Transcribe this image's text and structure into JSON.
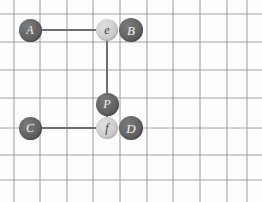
{
  "figure": {
    "name": "go-board-diagram",
    "width": 262,
    "height": 202,
    "background_color": "#fdfdfd"
  },
  "board": {
    "grid_color": "#8c8c8c",
    "grid_line_width": 1,
    "vertical_lines_x": [
      14,
      40,
      67,
      93,
      120,
      147,
      173,
      200,
      227,
      247
    ],
    "horizontal_lines_y": [
      14,
      42,
      70,
      98,
      128,
      155,
      180
    ],
    "cell_size": 26.6
  },
  "chains": {
    "color": "#6f6f6f",
    "line_width": 2,
    "segments": [
      {
        "name": "chain-a-e",
        "x1": 30,
        "y1": 30,
        "x2": 107,
        "y2": 30
      },
      {
        "name": "chain-e-p",
        "x1": 107,
        "y1": 30,
        "x2": 107,
        "y2": 104
      },
      {
        "name": "chain-p-f",
        "x1": 107,
        "y1": 104,
        "x2": 107,
        "y2": 128
      },
      {
        "name": "chain-c-f",
        "x1": 30,
        "y1": 128,
        "x2": 107,
        "y2": 128
      }
    ]
  },
  "stones": [
    {
      "label": "A",
      "color": "dark",
      "cx": 30,
      "cy": 30,
      "r": 11.5
    },
    {
      "label": "e",
      "color": "light",
      "cx": 107,
      "cy": 30,
      "r": 11.0
    },
    {
      "label": "B",
      "color": "dark",
      "cx": 131,
      "cy": 30,
      "r": 12.0
    },
    {
      "label": "P",
      "color": "dark",
      "cx": 107,
      "cy": 104,
      "r": 11.5
    },
    {
      "label": "C",
      "color": "dark",
      "cx": 30,
      "cy": 128,
      "r": 11.5
    },
    {
      "label": "f",
      "color": "light",
      "cx": 107,
      "cy": 128,
      "r": 11.0
    },
    {
      "label": "D",
      "color": "dark",
      "cx": 131,
      "cy": 128,
      "r": 12.0
    }
  ],
  "stone_colors": {
    "dark_fill": "#5f5f5f",
    "dark_text": "#f2f2f2",
    "light_fill": "#cfcfcf",
    "light_text": "#3a3a3a"
  }
}
